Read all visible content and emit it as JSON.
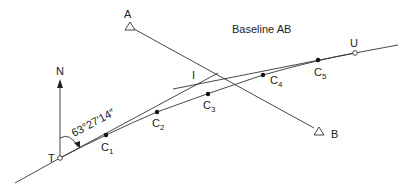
{
  "title": "Baseline AB",
  "north_label": "N",
  "bearing_label": "63°27′14″",
  "points": {
    "T": {
      "label": "T",
      "x": 60,
      "y": 158
    },
    "U": {
      "label": "U",
      "x": 355,
      "y": 53
    },
    "I": {
      "label": "I",
      "x": 196,
      "y": 84
    },
    "A": {
      "label": "A",
      "x": 130,
      "y": 27
    },
    "B": {
      "label": "B",
      "x": 319,
      "y": 132
    }
  },
  "chainage_points": [
    {
      "label": "C",
      "sub": "1",
      "x": 106,
      "y": 135
    },
    {
      "label": "C",
      "sub": "2",
      "x": 157,
      "y": 112
    },
    {
      "label": "C",
      "sub": "3",
      "x": 208,
      "y": 94
    },
    {
      "label": "C",
      "sub": "4",
      "x": 263,
      "y": 75
    },
    {
      "label": "C",
      "sub": "5",
      "x": 318,
      "y": 60
    }
  ],
  "colors": {
    "line": "#333333",
    "text": "#222222",
    "background": "#ffffff"
  }
}
